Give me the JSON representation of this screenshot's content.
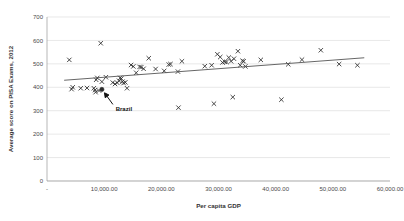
{
  "chart_data": {
    "type": "scatter",
    "title": "",
    "xlabel": "Per capita GDP",
    "ylabel": "Average score on PISA Exams, 2012",
    "xlim": [
      0,
      60000
    ],
    "ylim": [
      0,
      700
    ],
    "grid": true,
    "legend": "none",
    "x_tick_labels": [
      "-",
      "10,000.00",
      "20,000.00",
      "30,000.00",
      "40,000.00",
      "50,000.00",
      "60,000.00"
    ],
    "x_tick_values": [
      0,
      10000,
      20000,
      30000,
      40000,
      50000,
      60000
    ],
    "y_tick_labels": [
      "0",
      "100",
      "200",
      "300",
      "400",
      "500",
      "600",
      "700"
    ],
    "y_tick_values": [
      0,
      100,
      200,
      300,
      400,
      500,
      600,
      700
    ],
    "marker_symbol": "x",
    "series": [
      {
        "name": "Countries",
        "points": [
          [
            3900,
            517
          ],
          [
            4300,
            392
          ],
          [
            4500,
            400
          ],
          [
            5900,
            396
          ],
          [
            7000,
            397
          ],
          [
            8200,
            396
          ],
          [
            8400,
            388
          ],
          [
            8500,
            379
          ],
          [
            8600,
            432
          ],
          [
            8800,
            440
          ],
          [
            9100,
            386
          ],
          [
            9400,
            588
          ],
          [
            9600,
            424
          ],
          [
            10300,
            443
          ],
          [
            11500,
            420
          ],
          [
            11900,
            414
          ],
          [
            12300,
            419
          ],
          [
            12600,
            428
          ],
          [
            12800,
            440
          ],
          [
            13000,
            437
          ],
          [
            13200,
            424
          ],
          [
            13400,
            418
          ],
          [
            13700,
            421
          ],
          [
            14000,
            396
          ],
          [
            14700,
            495
          ],
          [
            15100,
            489
          ],
          [
            15600,
            462
          ],
          [
            16200,
            487
          ],
          [
            16500,
            486
          ],
          [
            16900,
            479
          ],
          [
            17800,
            524
          ],
          [
            19000,
            478
          ],
          [
            20500,
            470
          ],
          [
            21300,
            497
          ],
          [
            21600,
            499
          ],
          [
            22900,
            467
          ],
          [
            23000,
            313
          ],
          [
            23600,
            511
          ],
          [
            27600,
            490
          ],
          [
            28800,
            494
          ],
          [
            29200,
            330
          ],
          [
            29800,
            541
          ],
          [
            30300,
            529
          ],
          [
            30700,
            506
          ],
          [
            31100,
            509
          ],
          [
            31400,
            508
          ],
          [
            31800,
            527
          ],
          [
            32200,
            511
          ],
          [
            32500,
            358
          ],
          [
            32700,
            522
          ],
          [
            33400,
            554
          ],
          [
            33800,
            494
          ],
          [
            34200,
            513
          ],
          [
            34400,
            511
          ],
          [
            34700,
            489
          ],
          [
            37400,
            517
          ],
          [
            41000,
            347
          ],
          [
            42200,
            498
          ],
          [
            44600,
            518
          ],
          [
            47900,
            558
          ],
          [
            51100,
            499
          ],
          [
            54300,
            494
          ]
        ]
      }
    ],
    "highlight_point": {
      "label": "Brazil",
      "x": 9600,
      "y": 391,
      "marker": "filled-circle"
    },
    "trendline": {
      "from": [
        3000,
        430
      ],
      "to": [
        55500,
        526
      ]
    }
  }
}
